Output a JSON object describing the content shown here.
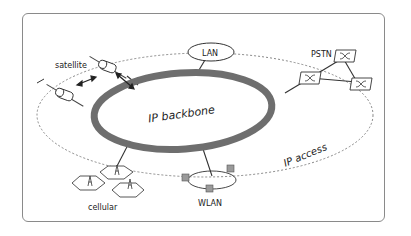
{
  "diagram": {
    "core": {
      "label": "IP backbone"
    },
    "access_ring": {
      "label": "IP access"
    },
    "nodes": [
      {
        "id": "satellite",
        "label": "satellite"
      },
      {
        "id": "lan",
        "label": "LAN"
      },
      {
        "id": "pstn",
        "label": "PSTN"
      },
      {
        "id": "cellular",
        "label": "cellular"
      },
      {
        "id": "wlan",
        "label": "WLAN"
      }
    ],
    "colors": {
      "backbone": "#6e6e6e",
      "line": "#333333",
      "dashed": "#888888",
      "frame": "#8a8a8a"
    }
  }
}
